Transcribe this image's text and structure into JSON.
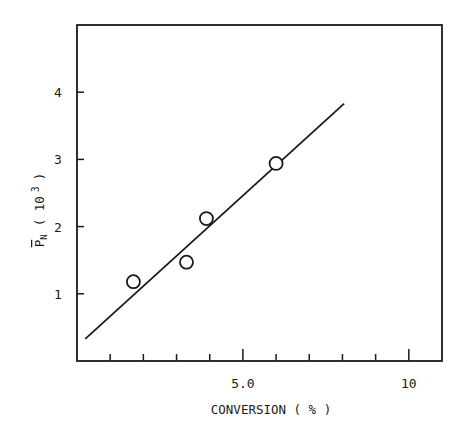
{
  "chart_data": {
    "type": "scatter",
    "title": "",
    "xlabel": "CONVERSION ( % )",
    "ylabel": "P̄N ( 10 3 )",
    "ylabel_parts": {
      "symbol": "P",
      "subscript": "N",
      "unit_open": "( 10",
      "unit_exp": "3",
      "unit_close": ")"
    },
    "xlim": [
      0,
      11
    ],
    "ylim": [
      0,
      5
    ],
    "x_ticks_major": [
      {
        "value": 5,
        "label": "5.0"
      },
      {
        "value": 10,
        "label": "10"
      }
    ],
    "x_ticks_minor": [
      1,
      2,
      3,
      4,
      6,
      7,
      8,
      9
    ],
    "y_ticks": [
      {
        "value": 1,
        "label": "1"
      },
      {
        "value": 2,
        "label": "2"
      },
      {
        "value": 3,
        "label": "3"
      },
      {
        "value": 4,
        "label": "4"
      }
    ],
    "grid": false,
    "legend": null,
    "series": [
      {
        "name": "measured",
        "marker": "open-circle",
        "points": [
          {
            "x": 1.7,
            "y": 1.18
          },
          {
            "x": 3.3,
            "y": 1.47
          },
          {
            "x": 3.9,
            "y": 2.12
          },
          {
            "x": 6.0,
            "y": 2.94
          }
        ]
      },
      {
        "name": "fit",
        "type": "line",
        "points": [
          {
            "x": 0.25,
            "y": 0.33
          },
          {
            "x": 8.05,
            "y": 3.83
          }
        ]
      }
    ],
    "colors": {
      "axis": "#1a1a1a",
      "marker": "#1a1a1a",
      "line": "#1a1a1a",
      "background": "#ffffff"
    }
  }
}
